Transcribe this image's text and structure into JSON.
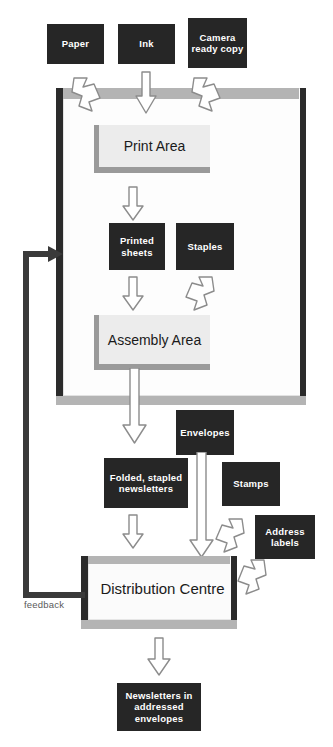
{
  "diagram": {
    "colors": {
      "material_box_fill": "#262626",
      "material_box_text": "#ffffff",
      "process_box_fill": "#ececec",
      "process_box_shadow": "#9a9a9a",
      "container_band": "#b4b4b4",
      "container_edge_dark": "#2b2b2b",
      "arrow_outline": "#8c8c8c",
      "arrow_fill": "#ffffff",
      "feedback_line": "#3a3a3a",
      "background": "#ffffff"
    }
  },
  "inputs": [
    {
      "id": "paper",
      "label": "Paper"
    },
    {
      "id": "ink",
      "label": "Ink"
    },
    {
      "id": "camera-ready-copy",
      "label": "Camera ready copy"
    }
  ],
  "process": {
    "print_area": {
      "label": "Print Area"
    },
    "assembly_area": {
      "label": "Assembly Area"
    }
  },
  "intermediates": [
    {
      "id": "printed-sheets",
      "label": "Printed sheets"
    },
    {
      "id": "staples",
      "label": "Staples"
    },
    {
      "id": "folded-stapled-newsletters",
      "label": "Folded, stapled newsletters"
    },
    {
      "id": "envelopes",
      "label": "Envelopes"
    },
    {
      "id": "stamps",
      "label": "Stamps"
    },
    {
      "id": "address-labels",
      "label": "Address labels"
    }
  ],
  "distribution": {
    "label": "Distribution Centre"
  },
  "output": {
    "label": "Newsletters in addressed envelopes"
  },
  "feedback": {
    "label": "feedback"
  }
}
